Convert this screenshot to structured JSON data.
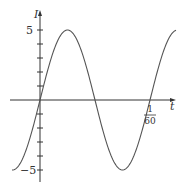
{
  "chart_data": {
    "type": "line",
    "title": "",
    "xlabel": "t",
    "ylabel": "I",
    "function": "I = 5 sin(120πt)",
    "x_tick_labels": [
      {
        "value": "1/60",
        "numerator": "1",
        "denominator": "60"
      }
    ],
    "y_tick_labels": [
      "5",
      "−5"
    ],
    "ylim": [
      -5,
      5
    ],
    "xlim": [
      -0.004,
      0.0175
    ],
    "grid": false,
    "legend": null,
    "series": [
      {
        "name": "I(t)",
        "amplitude": 5,
        "period": "1/60"
      }
    ]
  },
  "labels": {
    "y_axis": "I",
    "x_axis": "t",
    "y_max": "5",
    "y_min": "−5",
    "x_tick_num": "1",
    "x_tick_den": "60"
  }
}
